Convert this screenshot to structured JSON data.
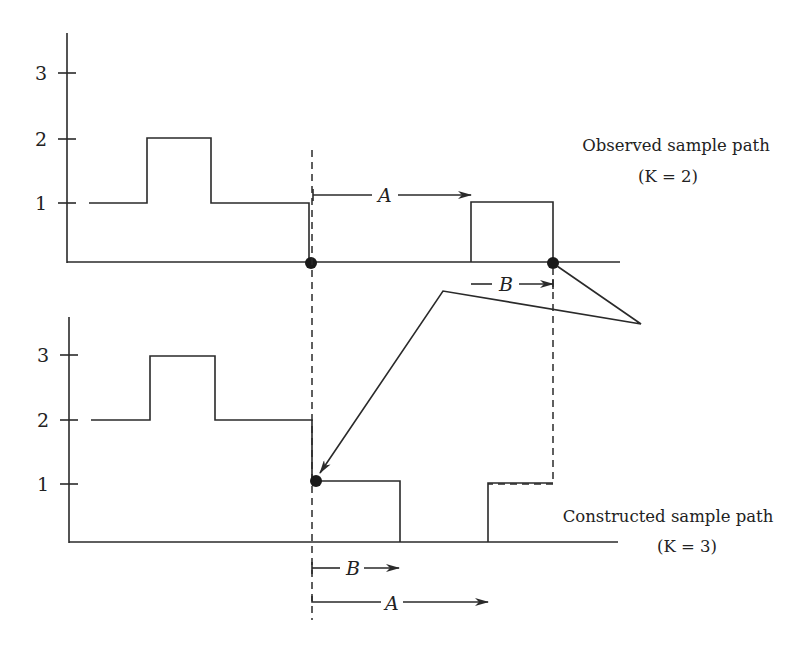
{
  "upper_panel": {
    "y_ticks": [
      "1",
      "2",
      "3"
    ],
    "caption_line1": "Observed sample path",
    "caption_line2": "(K = 2)",
    "arrow_a_label": "A",
    "arrow_b_label": "B"
  },
  "lower_panel": {
    "y_ticks": [
      "1",
      "2",
      "3"
    ],
    "caption_line1": "Constructed sample path",
    "caption_line2": "(K = 3)",
    "arrow_a_label": "A",
    "arrow_b_label": "B"
  },
  "colors": {
    "line": "#2a2a2a",
    "background": "#ffffff"
  }
}
